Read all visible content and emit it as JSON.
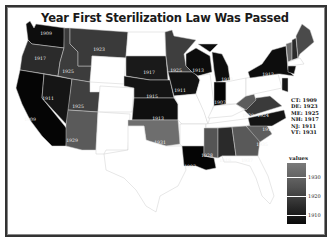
{
  "title": "Year First Sterilization Law Was Passed",
  "colors": {
    "background": "#ffffff",
    "no_law": "#ffffff",
    "early": "#0d0d0d",
    "mid": "#3a3a3a",
    "late": "#6e6e6e",
    "border": "#333333"
  },
  "states": [
    {
      "id": "WA",
      "year": "1909"
    },
    {
      "id": "OR",
      "year": "1917"
    },
    {
      "id": "CA",
      "year": "1909"
    },
    {
      "id": "ID",
      "year": "1925"
    },
    {
      "id": "NV",
      "year": "1911"
    },
    {
      "id": "MT",
      "year": "1923"
    },
    {
      "id": "UT",
      "year": "1925"
    },
    {
      "id": "AZ",
      "year": "1929"
    },
    {
      "id": "ND",
      "year": "1913"
    },
    {
      "id": "SD",
      "year": "1917"
    },
    {
      "id": "NE",
      "year": "1915"
    },
    {
      "id": "KS",
      "year": "1913"
    },
    {
      "id": "OK",
      "year": "1931"
    },
    {
      "id": "MN",
      "year": "1925"
    },
    {
      "id": "IA",
      "year": "1911"
    },
    {
      "id": "WI",
      "year": "1913"
    },
    {
      "id": "MI",
      "year": "1913"
    },
    {
      "id": "IN",
      "year": "1907"
    },
    {
      "id": "NY",
      "year": "1912"
    },
    {
      "id": "WV",
      "year": "1929"
    },
    {
      "id": "VA",
      "year": "1924"
    },
    {
      "id": "NC",
      "year": "1919"
    },
    {
      "id": "SC",
      "year": "1935"
    },
    {
      "id": "GA",
      "year": "1937"
    },
    {
      "id": "AL",
      "year": "1919"
    },
    {
      "id": "MS",
      "year": "1928"
    },
    {
      "id": "LA",
      "year": "1907"
    }
  ],
  "northeast_note": [
    "CT: 1909",
    "DE: 1923",
    "ME: 1925",
    "NH: 1917",
    "NJ: 1911",
    "VT: 1931"
  ],
  "legend": {
    "title": "values",
    "ticks": [
      "1930",
      "1920",
      "1910"
    ]
  }
}
